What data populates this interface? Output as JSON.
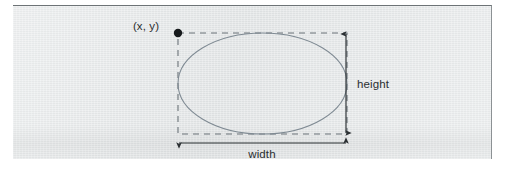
{
  "figure": {
    "type": "geometry-diagram",
    "labels": {
      "anchor_point": "(x, y)",
      "height": "height",
      "width": "width"
    },
    "colors": {
      "panel_background": "#e6e9ea",
      "panel_border_top": "#6d7376",
      "ellipse_stroke": "#7f8a93",
      "dashed_box_stroke": "#6b7378",
      "dimension_arrow_stroke": "#2b3033",
      "anchor_dot_fill": "#161a1c",
      "text": "#2b2f31"
    },
    "geometry": {
      "bounding_box": {
        "x": 178,
        "y": 33,
        "width": 169,
        "height": 101
      },
      "ellipse": {
        "cx": 262.5,
        "cy": 83.5,
        "rx": 84.5,
        "ry": 50.5
      },
      "anchor_dot": {
        "cx": 178,
        "cy": 33,
        "r": 4
      },
      "height_arrow": {
        "x": 346,
        "y1": 33,
        "y2": 134
      },
      "width_arrow": {
        "y": 143,
        "x1": 178,
        "x2": 347
      }
    }
  }
}
